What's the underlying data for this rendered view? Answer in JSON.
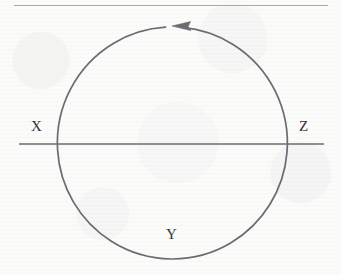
{
  "figure": {
    "kind": "circular-path-diagram",
    "background_color": "#fbfbfa",
    "stroke_color": "#6b6b73",
    "label_color": "#35353a",
    "top_rule": {
      "name": "horizontal-rule",
      "x1": 14,
      "y1": 5,
      "x2": 328,
      "y2": 5,
      "color": "#a8a8ae",
      "width": 1
    },
    "circle": {
      "name": "circular-path",
      "cx": 173,
      "cy": 143,
      "rx": 115,
      "ry": 116,
      "stroke_width": 1.7,
      "gap_degrees": 6
    },
    "arrow": {
      "name": "counterclockwise-arrow",
      "direction": "counterclockwise",
      "points": "left",
      "tip_x": 172,
      "tip_y": 26,
      "length": 18,
      "half_height": 5
    },
    "axis_line": {
      "name": "horizontal-axis-line",
      "x1": 19,
      "y1": 144,
      "x2": 324,
      "y2": 144,
      "stroke_width": 1.7
    },
    "labels": [
      {
        "id": "x",
        "text": "X",
        "x": 31,
        "y": 119,
        "position": "left-of-circle"
      },
      {
        "id": "z",
        "text": "Z",
        "x": 299,
        "y": 119,
        "position": "right-of-circle"
      },
      {
        "id": "y",
        "text": "Y",
        "x": 166,
        "y": 227,
        "position": "bottom-inside-circle"
      }
    ]
  }
}
